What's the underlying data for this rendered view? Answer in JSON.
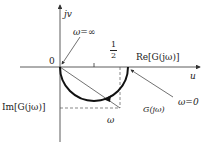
{
  "diagram": {
    "axes": {
      "vertical_label": "jv",
      "horizontal_label": "u",
      "origin_label": "0"
    },
    "labels": {
      "omega_inf": "ω=∞",
      "half_num": "1",
      "half_den": "2",
      "re_label": "Re[G(jω)]",
      "im_label": "Im[G(jω)]",
      "omega_zero": "ω=0",
      "g_point": "G(jω)",
      "omega_dir": "ω"
    },
    "colors": {
      "curve": "#111111",
      "axis": "#333333",
      "dashed": "#555555"
    }
  }
}
